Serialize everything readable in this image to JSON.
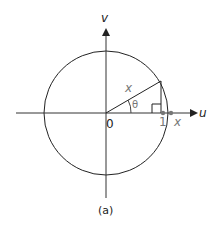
{
  "figure": {
    "caption": "(a)",
    "axes": {
      "horizontal_label": "u",
      "vertical_label": "v",
      "origin_label": "0"
    },
    "labels": {
      "radius": "x",
      "angle": "θ",
      "unit_tick": "1",
      "x_tick": "x"
    },
    "colors": {
      "line": "#222222",
      "label_grey": "#777777",
      "background": "#ffffff"
    }
  }
}
